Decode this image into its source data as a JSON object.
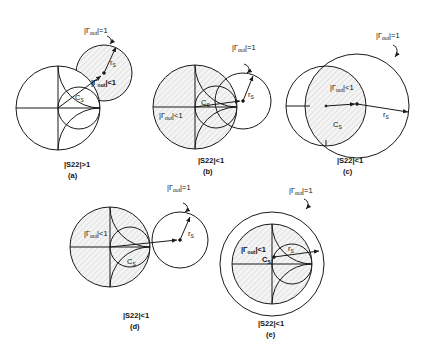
{
  "figure": {
    "panels": [
      {
        "id": "a",
        "tag": "(a)",
        "condition": "|S22|>1",
        "label_unit": "|Γ",
        "label_unit_sub": "out",
        "label_unit_suffix": "|=1",
        "label_stable": "|Γ",
        "label_stable_sub": "out",
        "label_stable_suffix": "|<1",
        "center_label": "C",
        "center_label_sub": "S",
        "radius_label": "r",
        "radius_label_sub": "S"
      },
      {
        "id": "b",
        "tag": "(b)",
        "condition": "|S22|<1",
        "label_unit": "|Γ",
        "label_unit_sub": "out",
        "label_unit_suffix": "|=1",
        "label_stable": "|Γ",
        "label_stable_sub": "out",
        "label_stable_suffix": "|<1",
        "center_label": "C",
        "center_label_sub": "S",
        "radius_label": "r",
        "radius_label_sub": "S"
      },
      {
        "id": "c",
        "tag": "(c)",
        "condition": "|S22|<1",
        "label_unit": "|Γ",
        "label_unit_sub": "out",
        "label_unit_suffix": "|=1",
        "label_stable": "|Γ",
        "label_stable_sub": "out",
        "label_stable_suffix": "|<1",
        "center_label": "C",
        "center_label_sub": "S",
        "radius_label": "r",
        "radius_label_sub": "S"
      },
      {
        "id": "d",
        "tag": "(d)",
        "condition": "|S22|<1",
        "label_unit": "|Γ",
        "label_unit_sub": "out",
        "label_unit_suffix": "|=1",
        "label_stable": "|Γ",
        "label_stable_sub": "out",
        "label_stable_suffix": "|<1",
        "center_label": "C",
        "center_label_sub": "S",
        "radius_label": "r",
        "radius_label_sub": "S"
      },
      {
        "id": "e",
        "tag": "(e)",
        "condition": "|S22|<1",
        "label_unit": "|Γ",
        "label_unit_sub": "out",
        "label_unit_suffix": "|=1",
        "label_stable": "|Γ",
        "label_stable_sub": "out",
        "label_stable_suffix": "|<1",
        "center_label": "C",
        "center_label_sub": "S",
        "radius_label": "r",
        "radius_label_sub": "S"
      }
    ]
  },
  "colors": {
    "stroke": "#1a1a1a",
    "hatch": "#c8c8c8",
    "background": "#ffffff"
  }
}
